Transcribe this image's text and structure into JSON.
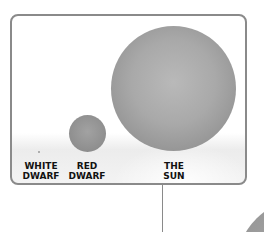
{
  "diagram": {
    "type": "star-size-comparison",
    "items": [
      {
        "label_line1": "WHITE",
        "label_line2": "DWARF",
        "relative_size": "tiny"
      },
      {
        "label_line1": "RED",
        "label_line2": "DWARF",
        "relative_size": "small"
      },
      {
        "label_line1": "THE",
        "label_line2": "SUN",
        "relative_size": "large"
      }
    ],
    "colors": {
      "border": "#8a8a8a",
      "star": "#a8a8a8",
      "text": "#111111"
    }
  }
}
